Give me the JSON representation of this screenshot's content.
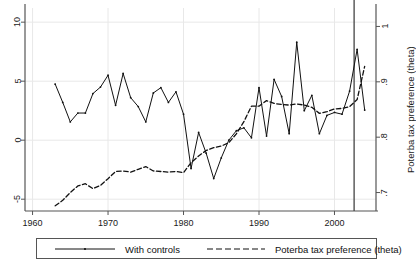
{
  "chart_data": {
    "type": "line",
    "title": "",
    "xlabel": "",
    "ylabel": "",
    "ylabel_right": "Poterba tax preference (theta)",
    "grid": true,
    "legend_position": "bottom",
    "xlim": [
      1959,
      2005.5
    ],
    "ylim_left": [
      -6.0,
      11.2
    ],
    "ylim_right": [
      0.6667,
      1.0333
    ],
    "xticks": [
      1960,
      1970,
      1980,
      1990,
      2000
    ],
    "xticklabels": [
      "1960",
      "1970",
      "1980",
      "1990",
      "2000"
    ],
    "yticks_left": [
      -5,
      0,
      5,
      10
    ],
    "yticklabels_left": [
      "-5",
      "0",
      "5",
      "10"
    ],
    "yticks_right": [
      0.7,
      0.8,
      0.9,
      1.0
    ],
    "yticklabels_right": [
      ".7",
      ".8",
      ".9",
      "1"
    ],
    "annotations": [
      {
        "type": "vline",
        "x": 2002.6,
        "label": ""
      }
    ],
    "series": [
      {
        "name": "With controls",
        "axis": "left",
        "style": "solid",
        "marker": true,
        "color": "#111111",
        "x": [
          1963,
          1964,
          1965,
          1966,
          1967,
          1968,
          1969,
          1970,
          1971,
          1972,
          1973,
          1974,
          1975,
          1976,
          1977,
          1978,
          1979,
          1980,
          1981,
          1982,
          1983,
          1984,
          1985,
          1986,
          1987,
          1988,
          1989,
          1990,
          1991,
          1992,
          1993,
          1994,
          1995,
          1996,
          1997,
          1998,
          1999,
          2000,
          2001,
          2002,
          2003,
          2004
        ],
        "values": [
          4.75,
          3.2,
          1.55,
          2.3,
          2.3,
          3.95,
          4.5,
          5.5,
          2.95,
          5.65,
          3.6,
          2.85,
          1.55,
          4.0,
          4.45,
          3.2,
          4.1,
          2.2,
          -2.4,
          0.65,
          -1.1,
          -3.25,
          -1.5,
          0.0,
          0.8,
          1.05,
          0.2,
          4.45,
          0.35,
          5.15,
          3.7,
          0.55,
          8.3,
          2.5,
          3.8,
          0.55,
          2.1,
          2.35,
          2.2,
          4.15,
          7.7,
          2.55
        ]
      },
      {
        "name": "Poterba tax preference (theta)",
        "axis": "right",
        "style": "dashed",
        "marker": false,
        "color": "#111111",
        "x": [
          1963,
          1964,
          1965,
          1966,
          1967,
          1968,
          1969,
          1970,
          1971,
          1972,
          1973,
          1974,
          1975,
          1976,
          1977,
          1978,
          1979,
          1980,
          1981,
          1982,
          1983,
          1984,
          1985,
          1986,
          1987,
          1988,
          1989,
          1990,
          1991,
          1992,
          1993,
          1994,
          1995,
          1996,
          1997,
          1998,
          1999,
          2000,
          2001,
          2002,
          2003,
          2004
        ],
        "values": [
          0.676,
          0.686,
          0.7,
          0.712,
          0.716,
          0.707,
          0.713,
          0.725,
          0.738,
          0.739,
          0.737,
          0.742,
          0.747,
          0.739,
          0.738,
          0.737,
          0.738,
          0.736,
          0.754,
          0.766,
          0.776,
          0.781,
          0.784,
          0.79,
          0.806,
          0.828,
          0.856,
          0.856,
          0.866,
          0.861,
          0.859,
          0.858,
          0.86,
          0.858,
          0.854,
          0.843,
          0.846,
          0.851,
          0.852,
          0.855,
          0.868,
          0.928
        ]
      }
    ]
  },
  "legend": {
    "entries": [
      {
        "label": "With controls",
        "style": "solid-marker"
      },
      {
        "label": "Poterba tax preference (theta)",
        "style": "dashed"
      }
    ]
  }
}
